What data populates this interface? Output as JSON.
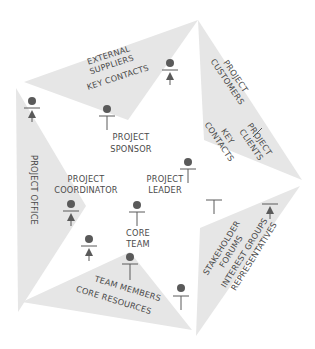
{
  "diagram": {
    "type": "stakeholder-pentagon",
    "colors": {
      "segment_fill": "#e6e6e6",
      "text": "#4a4a4a",
      "figure": "#5a5a5a",
      "background": "#ffffff"
    },
    "segments": [
      {
        "id": "top",
        "lines": [
          "EXTERNAL",
          "SUPPLIERS",
          "KEY CONTACTS"
        ]
      },
      {
        "id": "right",
        "group_a": [
          "PROJECT",
          "CUSTOMERS"
        ],
        "group_b": [
          "KEY",
          "CONTACTS"
        ],
        "group_c": [
          "PROJECT",
          "CLIENTS"
        ]
      },
      {
        "id": "bottom-right",
        "lines": [
          "STAKEHOLDER",
          "FORUMS",
          "INTEREST GROUPS",
          "REPRESENTATIVES"
        ]
      },
      {
        "id": "bottom",
        "lines": [
          "TEAM MEMBERS",
          "CORE RESOURCES"
        ]
      },
      {
        "id": "left",
        "lines": [
          "PROJECT OFFICE"
        ]
      }
    ],
    "roles": {
      "sponsor": [
        "PROJECT",
        "SPONSOR"
      ],
      "coordinator": [
        "PROJECT",
        "COORDINATOR"
      ],
      "leader": [
        "PROJECT",
        "LEADER"
      ],
      "core_team": [
        "CORE",
        "TEAM"
      ]
    }
  }
}
